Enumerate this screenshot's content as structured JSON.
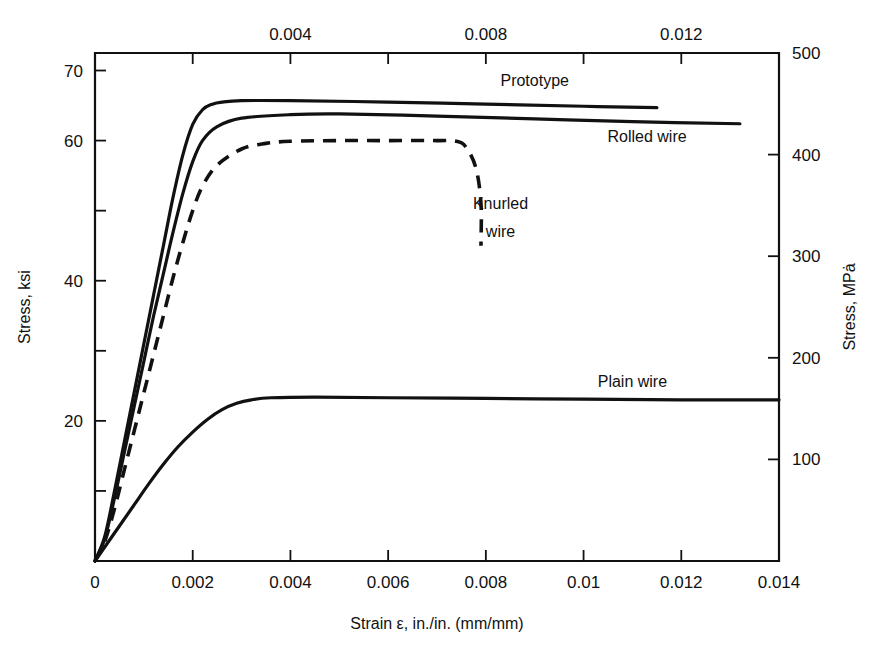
{
  "chart_data": {
    "type": "line",
    "title": "",
    "xlabel": "Strain ε, in./in. (mm/mm)",
    "ylabel": "Stress, ksi",
    "y2label": "Stress, MPȧ",
    "x2label": "",
    "xlim": [
      0,
      0.014
    ],
    "ylim": [
      0,
      72.5
    ],
    "y2lim": [
      0,
      500
    ],
    "grid": false,
    "legend_position": "inline-labels",
    "x_ticks": [
      0,
      0.002,
      0.004,
      0.006,
      0.008,
      0.01,
      0.012,
      0.014
    ],
    "x_tick_labels": [
      "0",
      "0.002",
      "0.004",
      "0.006",
      "0.008",
      "0.01",
      "0.012",
      "0.014"
    ],
    "x_top_ticks": [
      0.002,
      0.004,
      0.006,
      0.008,
      0.01,
      0.012
    ],
    "x_top_tick_labels": [
      "",
      "0.004",
      "",
      "0.008",
      "",
      "0.012"
    ],
    "y_ticks": [
      10,
      20,
      30,
      40,
      50,
      60,
      70
    ],
    "y_tick_labels": [
      "",
      "20",
      "",
      "40",
      "",
      "60",
      "70"
    ],
    "y2_ticks": [
      100,
      200,
      300,
      400,
      500
    ],
    "y2_tick_labels": [
      "100",
      "200",
      "300",
      "400",
      "500"
    ],
    "series": [
      {
        "name": "Prototype",
        "style": "solid",
        "label": "Prototype",
        "plateau_ksi": 65.5,
        "plateau_mpa": 452,
        "x_end": 0.0115,
        "points": [
          [
            0.0,
            0.0
          ],
          [
            0.0002,
            3.5
          ],
          [
            0.0004,
            10.0
          ],
          [
            0.0006,
            17.0
          ],
          [
            0.0008,
            24.0
          ],
          [
            0.001,
            31.0
          ],
          [
            0.0012,
            38.0
          ],
          [
            0.0014,
            45.0
          ],
          [
            0.0016,
            52.0
          ],
          [
            0.0018,
            58.0
          ],
          [
            0.002,
            62.3
          ],
          [
            0.0022,
            64.4
          ],
          [
            0.0024,
            65.2
          ],
          [
            0.0026,
            65.5
          ],
          [
            0.003,
            65.7
          ],
          [
            0.004,
            65.7
          ],
          [
            0.006,
            65.5
          ],
          [
            0.008,
            65.2
          ],
          [
            0.01,
            64.9
          ],
          [
            0.0115,
            64.7
          ]
        ]
      },
      {
        "name": "Rolled wire",
        "style": "solid",
        "label": "Rolled wire",
        "plateau_ksi": 63.5,
        "plateau_mpa": 438,
        "x_end": 0.0132,
        "points": [
          [
            0.0,
            0.0
          ],
          [
            0.0002,
            3.2
          ],
          [
            0.0004,
            9.0
          ],
          [
            0.0006,
            15.5
          ],
          [
            0.0008,
            22.0
          ],
          [
            0.001,
            28.5
          ],
          [
            0.0012,
            35.0
          ],
          [
            0.0014,
            41.0
          ],
          [
            0.0016,
            47.0
          ],
          [
            0.0018,
            52.5
          ],
          [
            0.002,
            57.0
          ],
          [
            0.0022,
            60.0
          ],
          [
            0.0025,
            62.0
          ],
          [
            0.003,
            63.2
          ],
          [
            0.004,
            63.7
          ],
          [
            0.005,
            63.8
          ],
          [
            0.007,
            63.5
          ],
          [
            0.009,
            63.1
          ],
          [
            0.011,
            62.7
          ],
          [
            0.0132,
            62.4
          ]
        ]
      },
      {
        "name": "Knurled wire",
        "style": "dashed",
        "label": "Knurled\nwire",
        "plateau_ksi": 60.0,
        "plateau_mpa": 414,
        "x_end": 0.0079,
        "fracture": true,
        "points": [
          [
            0.0,
            0.0
          ],
          [
            0.0002,
            2.8
          ],
          [
            0.0004,
            7.5
          ],
          [
            0.0006,
            13.0
          ],
          [
            0.0008,
            18.5
          ],
          [
            0.001,
            24.0
          ],
          [
            0.0012,
            29.5
          ],
          [
            0.0014,
            35.0
          ],
          [
            0.0016,
            40.5
          ],
          [
            0.0018,
            45.5
          ],
          [
            0.002,
            50.0
          ],
          [
            0.0022,
            53.5
          ],
          [
            0.0025,
            56.5
          ],
          [
            0.003,
            58.8
          ],
          [
            0.0035,
            59.6
          ],
          [
            0.004,
            59.9
          ],
          [
            0.005,
            60.0
          ],
          [
            0.006,
            60.0
          ],
          [
            0.007,
            60.0
          ],
          [
            0.0074,
            59.9
          ],
          [
            0.0076,
            59.0
          ],
          [
            0.0078,
            56.0
          ],
          [
            0.0079,
            51.0
          ],
          [
            0.0079,
            45.0
          ]
        ]
      },
      {
        "name": "Plain wire",
        "style": "solid",
        "label": "Plain wire",
        "plateau_ksi": 23.0,
        "plateau_mpa": 170,
        "x_end": 0.014,
        "points": [
          [
            0.0,
            0.0
          ],
          [
            0.0002,
            2.0
          ],
          [
            0.0005,
            5.0
          ],
          [
            0.0008,
            8.0
          ],
          [
            0.0011,
            11.0
          ],
          [
            0.0014,
            13.8
          ],
          [
            0.0017,
            16.3
          ],
          [
            0.002,
            18.4
          ],
          [
            0.0023,
            20.2
          ],
          [
            0.0026,
            21.6
          ],
          [
            0.0029,
            22.5
          ],
          [
            0.0032,
            23.0
          ],
          [
            0.0036,
            23.3
          ],
          [
            0.0045,
            23.4
          ],
          [
            0.006,
            23.3
          ],
          [
            0.008,
            23.2
          ],
          [
            0.01,
            23.1
          ],
          [
            0.012,
            23.0
          ],
          [
            0.014,
            23.0
          ]
        ]
      }
    ],
    "annotations": [
      {
        "text": "Prototype",
        "x": 0.009,
        "y": 68.5
      },
      {
        "text": "Rolled wire",
        "x": 0.0113,
        "y": 60.5
      },
      {
        "text": "Knurled",
        "x": 0.0083,
        "y": 51.0
      },
      {
        "text": "wire",
        "x": 0.0083,
        "y": 47.0
      },
      {
        "text": "Plain wire",
        "x": 0.011,
        "y": 25.5
      }
    ]
  }
}
